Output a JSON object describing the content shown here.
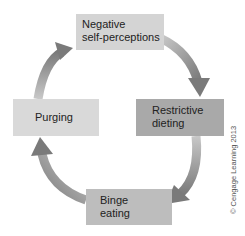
{
  "diagram": {
    "type": "cycle",
    "nodes": [
      {
        "id": "negative",
        "lines": [
          "Negative",
          "self-perceptions"
        ],
        "color": "#d4d4d4"
      },
      {
        "id": "restrictive",
        "lines": [
          "Restrictive",
          "dieting"
        ],
        "color": "#a9a9a9"
      },
      {
        "id": "binge",
        "lines": [
          "Binge",
          "eating"
        ],
        "color": "#bdbdbd"
      },
      {
        "id": "purging",
        "lines": [
          "Purging"
        ],
        "color": "#d9d9d9"
      }
    ],
    "edges": [
      {
        "from": "negative",
        "to": "restrictive"
      },
      {
        "from": "restrictive",
        "to": "binge"
      },
      {
        "from": "binge",
        "to": "purging"
      },
      {
        "from": "purging",
        "to": "negative"
      }
    ],
    "credit": "© Cengage Learning 2013"
  }
}
